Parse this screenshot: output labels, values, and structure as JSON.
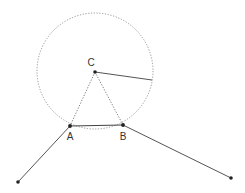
{
  "diagram": {
    "points": {
      "C": {
        "label": "C"
      },
      "A": {
        "label": "A"
      },
      "B": {
        "label": "B"
      }
    },
    "colors": {
      "line": "#555555",
      "dot": "#222222",
      "circle": "#888888"
    }
  }
}
